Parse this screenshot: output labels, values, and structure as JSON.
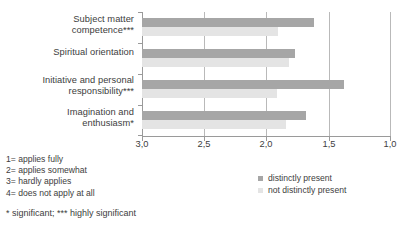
{
  "chart_data": {
    "type": "bar",
    "orientation": "horizontal",
    "title": "",
    "xlabel": "",
    "ylabel": "",
    "xlim": [
      3.0,
      1.0
    ],
    "x_reversed": true,
    "xticks": [
      "3,0",
      "2,5",
      "2,0",
      "1,5",
      "1,0"
    ],
    "xtick_values": [
      3.0,
      2.5,
      2.0,
      1.5,
      1.0
    ],
    "grid": true,
    "legend_position": "bottom-right",
    "categories": [
      "Subject matter competence***",
      "Spiritual orientation",
      "Initiative and personal responsibility***",
      "Imagination and enthusiasm*"
    ],
    "category_lines": [
      [
        "Subject matter",
        "competence***"
      ],
      [
        "Spiritual orientation"
      ],
      [
        "Initiative and personal",
        "responsibility***"
      ],
      [
        "Imagination and",
        "enthusiasm*"
      ]
    ],
    "series": [
      {
        "name": "distinctly present",
        "color": "#a6a6a6",
        "values": [
          1.62,
          1.77,
          1.38,
          1.68
        ]
      },
      {
        "name": "not distinctly present",
        "color": "#e4e4e4",
        "values": [
          1.91,
          1.82,
          1.92,
          1.84
        ]
      }
    ]
  },
  "scale_key": {
    "lines": [
      "1= applies fully",
      "2= applies somewhat",
      "3= hardly applies",
      "4= does not apply at all"
    ]
  },
  "footnote": {
    "text": "* significant;  *** highly significant"
  },
  "legend": {
    "items": [
      {
        "label": "distinctly present",
        "color": "#a6a6a6"
      },
      {
        "label": "not distinctly present",
        "color": "#e4e4e4"
      }
    ]
  }
}
